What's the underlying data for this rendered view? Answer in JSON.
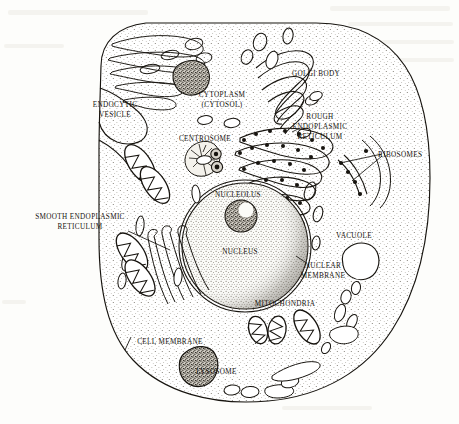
{
  "figure": {
    "kind": "biology-diagram",
    "style": "black-and-white line drawing with stipple shading",
    "width": 459,
    "height": 424,
    "background_color": "#fdfdfb",
    "ink_color": "#17140f"
  },
  "labels": [
    {
      "id": "endocytic-vesicle",
      "text": "ENDOCYTIC\nVESICLE",
      "x": 115,
      "y": 105,
      "align": "center"
    },
    {
      "id": "cytoplasm",
      "text": "CYTOPLASM\n(CYTOSOL)",
      "x": 222,
      "y": 95,
      "align": "center"
    },
    {
      "id": "golgi-body",
      "text": "GOLGI BODY",
      "x": 316,
      "y": 74,
      "align": "center"
    },
    {
      "id": "rough-er",
      "text": "ROUGH\nENDOPLASMIC\nRETICULUM",
      "x": 320,
      "y": 117,
      "align": "center"
    },
    {
      "id": "ribosomes",
      "text": "RIBOSOMES",
      "x": 410,
      "y": 155,
      "align": "center"
    },
    {
      "id": "centrosome",
      "text": "CENTROSOME",
      "x": 205,
      "y": 139,
      "align": "center"
    },
    {
      "id": "smooth-er",
      "text": "SMOOTH ENDOPLASMIC\nRETICULUM",
      "x": 80,
      "y": 218,
      "align": "center"
    },
    {
      "id": "nucleolus",
      "text": "NUCLEOLUS",
      "x": 238,
      "y": 195,
      "align": "center"
    },
    {
      "id": "nucleus",
      "text": "NUCLEUS",
      "x": 240,
      "y": 252,
      "align": "center"
    },
    {
      "id": "vacuole",
      "text": "VACUOLE",
      "x": 354,
      "y": 236,
      "align": "center"
    },
    {
      "id": "nuclear-membrane",
      "text": "NUCLEAR\nMEMBRANE",
      "x": 323,
      "y": 266,
      "align": "center"
    },
    {
      "id": "mitochondria",
      "text": "MITOCHONDRIA",
      "x": 285,
      "y": 304,
      "align": "center"
    },
    {
      "id": "cell-membrane",
      "text": "CELL MEMBRANE",
      "x": 170,
      "y": 342,
      "align": "center"
    },
    {
      "id": "lysosome",
      "text": "LYSOSOME",
      "x": 227,
      "y": 372,
      "align": "center"
    }
  ],
  "organelles": [
    {
      "id": "cell-membrane",
      "name": "Cell membrane",
      "count": 1
    },
    {
      "id": "cytoplasm",
      "name": "Cytoplasm (cytosol)",
      "count": 1
    },
    {
      "id": "nucleus",
      "name": "Nucleus",
      "count": 1
    },
    {
      "id": "nucleolus",
      "name": "Nucleolus",
      "count": 1
    },
    {
      "id": "nuclear-membrane",
      "name": "Nuclear membrane",
      "count": 1
    },
    {
      "id": "golgi-body",
      "name": "Golgi body",
      "count": 1
    },
    {
      "id": "rough-er",
      "name": "Rough endoplasmic reticulum",
      "count": 1
    },
    {
      "id": "smooth-er",
      "name": "Smooth endoplasmic reticulum",
      "count": 1
    },
    {
      "id": "ribosomes",
      "name": "Ribosomes",
      "count": 34
    },
    {
      "id": "mitochondria",
      "name": "Mitochondria",
      "count": 5
    },
    {
      "id": "lysosome",
      "name": "Lysosome",
      "count": 2
    },
    {
      "id": "vacuole",
      "name": "Vacuole",
      "count": 1
    },
    {
      "id": "centrosome",
      "name": "Centrosome",
      "count": 1
    },
    {
      "id": "endocytic-vesicle",
      "name": "Endocytic vesicle",
      "count": 1
    }
  ]
}
